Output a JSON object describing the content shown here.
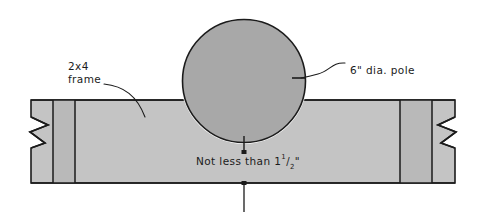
{
  "drawing": {
    "title_type": "construction-detail-elevation",
    "labels": {
      "frame_line1": "2x4",
      "frame_line2": "frame",
      "pole": "6\" dia. pole",
      "clearance_prefix": "Not less than 1",
      "clearance_numerator": "1",
      "clearance_slash": "/",
      "clearance_denominator": "2",
      "clearance_inch_mark": "\""
    },
    "colors": {
      "background": "#ffffff",
      "pole_fill": "#a8a8a8",
      "board_fill": "#c4c4c4",
      "board_fill_dark": "#bbbbbb",
      "outline": "#1b1b1b",
      "text": "#1b1b1b"
    },
    "geometry": {
      "pole_center_x": 244,
      "pole_center_y": 81,
      "pole_radius": 61,
      "board_left": 31,
      "board_right": 455,
      "board_top": 100,
      "board_bottom": 183,
      "divider_x": [
        53,
        75,
        400,
        432
      ],
      "dimension_line_x": 244,
      "dimension_top_y": 152,
      "dimension_bottom_y": 212
    }
  }
}
